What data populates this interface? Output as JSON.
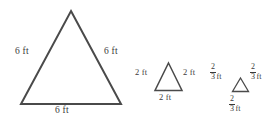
{
  "figure": {
    "background_color": "#ffffff",
    "stroke_color": "#4a4a4a",
    "text_color": "#3a3a3a",
    "unit": "ft"
  },
  "shapes": [
    {
      "name": "large-triangle",
      "shape": "equilateral-triangle",
      "side_length_text": "6 ft",
      "labels": {
        "left": "6 ft",
        "right": "6 ft",
        "bottom": "6 ft"
      }
    },
    {
      "name": "medium-triangle",
      "shape": "equilateral-triangle",
      "side_length_text": "2 ft",
      "labels": {
        "left": "2 ft",
        "right": "2 ft",
        "bottom": "2 ft"
      }
    },
    {
      "name": "small-triangle",
      "shape": "equilateral-triangle",
      "side_length_text": "2/3 ft",
      "labels": {
        "left": {
          "numerator": "2",
          "denominator": "3",
          "unit": "ft"
        },
        "right": {
          "numerator": "2",
          "denominator": "3",
          "unit": "ft"
        },
        "bottom": {
          "numerator": "2",
          "denominator": "3",
          "unit": "ft"
        }
      }
    }
  ]
}
